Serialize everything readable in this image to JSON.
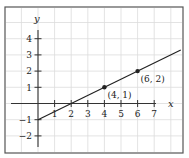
{
  "chart_data": {
    "type": "line",
    "title": "",
    "xlabel": "x",
    "ylabel": "y",
    "xlim": [
      -2,
      9
    ],
    "ylim": [
      -3,
      5
    ],
    "grid": true,
    "x_ticks": [
      1,
      2,
      3,
      4,
      5,
      6,
      7
    ],
    "x_tick_labels": [
      "1",
      "2",
      "3",
      "4",
      "5",
      "6",
      "7"
    ],
    "y_ticks": [
      4,
      3,
      2,
      1,
      -1,
      -2
    ],
    "y_tick_labels": [
      "4",
      "3",
      "2",
      "1",
      "−1",
      "−2"
    ],
    "series": [
      {
        "name": "line",
        "equation": "y = x/2 - 1",
        "x": [
          0,
          8.6
        ],
        "y": [
          -1,
          3.3
        ]
      }
    ],
    "points": [
      {
        "x": 4,
        "y": 1,
        "label": "(4, 1)"
      },
      {
        "x": 6,
        "y": 2,
        "label": "(6, 2)"
      }
    ],
    "annotations": [
      "(4, 1)",
      "(6, 2)"
    ]
  },
  "style": {
    "frame_color": "#555555",
    "grid_color": "#dcdcdc",
    "axis_color": "#333333",
    "line_color": "#222222",
    "background": "#ffffff"
  }
}
